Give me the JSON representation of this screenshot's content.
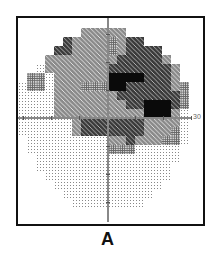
{
  "figure": {
    "panel_label": "A",
    "scale_label": "30",
    "type": "visual-field-grayscale-map"
  },
  "grid": {
    "origin_x": 18,
    "origin_y": 19,
    "cell": 9,
    "legend_levels": {
      "0": "white (normal)",
      "1": "sparse dots",
      "2": "dense dots",
      "3": "gray with light marks",
      "4": "dark checker",
      "5": "black (absolute defect)"
    },
    "rows": [
      "00000000000000000000",
      "00000003333300000000",
      "00000433332344000000",
      "00004433332344440000",
      "00033333333444443000",
      "00133333334444444300",
      "02213333335555444300",
      "12213332225544444320",
      "11113333333444444420",
      "11113333333344555420",
      "11113333333333555310",
      "11111134444444333310",
      "11111134444444333210",
      "01111111113343332210",
      "01111111112221111100",
      "00111111111111111100",
      "00111111111111111000",
      "00011111111111111000",
      "00001111111111110000",
      "00000111111111100000",
      "00000011111111000000",
      "00000000000000000000"
    ]
  }
}
